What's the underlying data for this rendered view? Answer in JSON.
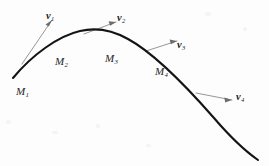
{
  "figure": {
    "kind": "tangent-vector-curve-diagram",
    "background_color": "#fdfdfd",
    "curve_color": "#141414",
    "vector_color": "#8a8a8a",
    "label_color": "#262626"
  },
  "points": [
    {
      "id": "M1",
      "base": "M",
      "subscript": "1",
      "x": 16,
      "y": 86
    },
    {
      "id": "M2",
      "base": "M",
      "subscript": "2",
      "x": 55,
      "y": 56
    },
    {
      "id": "M3",
      "base": "M",
      "subscript": "3",
      "x": 105,
      "y": 53
    },
    {
      "id": "M4",
      "base": "M",
      "subscript": "4",
      "x": 155,
      "y": 66
    }
  ],
  "vectors": [
    {
      "id": "v1",
      "base": "v",
      "subscript": "1",
      "label_x": 46,
      "label_y": 11
    },
    {
      "id": "v2",
      "base": "v",
      "subscript": "2",
      "label_x": 117,
      "label_y": 13
    },
    {
      "id": "v3",
      "base": "v",
      "subscript": "3",
      "label_x": 177,
      "label_y": 40
    },
    {
      "id": "v4",
      "base": "v",
      "subscript": "4",
      "label_x": 236,
      "label_y": 92
    }
  ],
  "geometry": {
    "curve_path": "M 13,78 C 32,55 58,36 80,31 C 95,27.5 112,30 128,39 C 152,52 186,86 214,118 C 232,139 248,153 258,160",
    "tangent_lines": [
      {
        "id": "tangent-1",
        "d": "M 22,64 L 52,20"
      },
      {
        "id": "tangent-2",
        "d": "M 84,34 L 116,22"
      },
      {
        "id": "tangent-3",
        "d": "M 146,51 L 177,41"
      },
      {
        "id": "tangent-4",
        "d": "M 196,93 L 232,100"
      }
    ],
    "arrow_heads": [
      {
        "id": "arrowhead-1",
        "points": "52,20 45.5,24.5 48.8,26.6"
      },
      {
        "id": "arrowhead-2",
        "points": "116,22 108.5,21.2 110.3,25.8"
      },
      {
        "id": "arrowhead-3",
        "points": "177,41 169.6,39.6 170.9,44.2"
      },
      {
        "id": "arrowhead-4",
        "points": "232,100 224.3,97.6 225.2,102.5"
      }
    ]
  }
}
